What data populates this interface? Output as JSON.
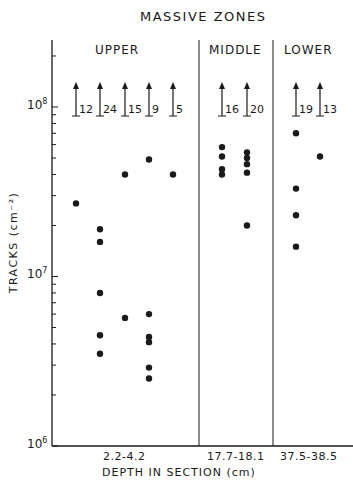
{
  "chart_data": {
    "type": "scatter",
    "title": "MASSIVE ZONES",
    "xlabel": "DEPTH IN SECTION (cm)",
    "ylabel": "TRACKS (cm^-2)",
    "yscale": "log",
    "ylim": [
      1000000,
      200000000
    ],
    "y_ticks": [
      "10^6",
      "10^7",
      "10^8"
    ],
    "grid": false,
    "legend": null,
    "zones": [
      {
        "name": "UPPER",
        "depth_range": "2.2-4.2"
      },
      {
        "name": "MIDDLE",
        "depth_range": "17.7-18.1"
      },
      {
        "name": "LOWER",
        "depth_range": "37.5-38.5"
      }
    ],
    "series": [
      {
        "zone": "UPPER",
        "lower_limit_arrow": 12,
        "values": [
          27000000
        ]
      },
      {
        "zone": "UPPER",
        "lower_limit_arrow": 24,
        "values": [
          19000000,
          16000000,
          8000000,
          4500000,
          3500000
        ]
      },
      {
        "zone": "UPPER",
        "lower_limit_arrow": 15,
        "values": [
          40000000,
          5700000
        ]
      },
      {
        "zone": "UPPER",
        "lower_limit_arrow": 9,
        "values": [
          49000000,
          6000000,
          4400000,
          4100000,
          2900000,
          2500000
        ]
      },
      {
        "zone": "UPPER",
        "lower_limit_arrow": 5,
        "values": [
          40000000
        ]
      },
      {
        "zone": "MIDDLE",
        "lower_limit_arrow": 16,
        "values": [
          58000000,
          51000000,
          43000000,
          40000000
        ]
      },
      {
        "zone": "MIDDLE",
        "lower_limit_arrow": 20,
        "values": [
          54000000,
          50000000,
          46000000,
          41000000,
          20000000
        ]
      },
      {
        "zone": "LOWER",
        "lower_limit_arrow": 19,
        "values": [
          70000000,
          33000000,
          23000000,
          15000000
        ]
      },
      {
        "zone": "LOWER",
        "lower_limit_arrow": 13,
        "values": [
          51000000
        ]
      }
    ],
    "annotations": [
      "Upward arrows with counts at ~1e8 indicate lower-limit values: 12, 24, 15, 9, 5, 16, 20, 19, 13"
    ]
  },
  "labels": {
    "title": "MASSIVE ZONES",
    "zone_upper": "UPPER",
    "zone_middle": "MIDDLE",
    "zone_lower": "LOWER",
    "ylabel": "TRACKS (cm⁻²)",
    "xlabel": "DEPTH IN SECTION (cm)",
    "xcat_upper": "2.2-4.2",
    "xcat_middle": "17.7-18.1",
    "xcat_lower": "37.5-38.5",
    "decade_base": "10",
    "exp8": "8",
    "exp7": "7",
    "exp6": "6"
  },
  "arrows": [
    {
      "x": 76,
      "label": "12"
    },
    {
      "x": 100,
      "label": "24"
    },
    {
      "x": 125,
      "label": "15"
    },
    {
      "x": 149,
      "label": "9"
    },
    {
      "x": 173,
      "label": "5"
    },
    {
      "x": 222,
      "label": "16"
    },
    {
      "x": 247,
      "label": "20"
    },
    {
      "x": 296,
      "label": "19"
    },
    {
      "x": 320,
      "label": "13"
    }
  ],
  "colors": {
    "ink": "#1a1a1a",
    "background": "#ffffff"
  }
}
